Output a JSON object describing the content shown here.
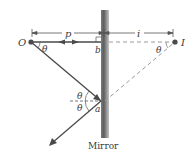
{
  "diagram": {
    "type": "plane-mirror-reflection",
    "labels": {
      "object": "O",
      "image": "I",
      "object_distance": "p",
      "image_distance": "i",
      "point_b": "b",
      "point_a": "a",
      "theta": "θ",
      "caption": "Mirror"
    },
    "colors": {
      "ray": "#4a4a4a",
      "dashed": "#9a9a9a",
      "mirror_dark": "#6e6e6e",
      "mirror_light": "#c8c8c8",
      "text": "#3a3a3a"
    }
  }
}
